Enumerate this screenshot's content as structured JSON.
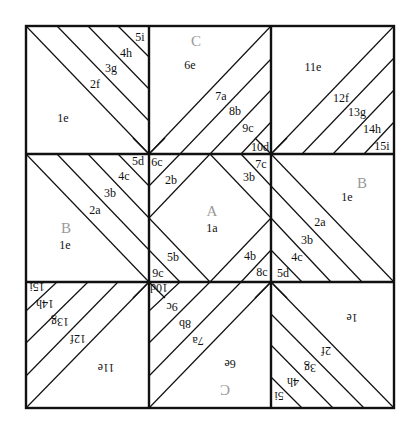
{
  "diagram": {
    "type": "quilt-block-foundation-pattern",
    "frame": {
      "x0": 26,
      "y0": 26,
      "x1": 394,
      "y1": 408
    },
    "grid": {
      "cols": [
        26,
        149,
        271,
        394
      ],
      "rows": [
        26,
        154,
        282,
        408
      ]
    },
    "colors": {
      "line": "#111111",
      "unit_letter": "#999999",
      "background": "#ffffff"
    },
    "units": [
      {
        "id": "C",
        "label": "C",
        "x": 196,
        "y": 41,
        "flip": false
      },
      {
        "id": "A",
        "label": "A",
        "x": 212,
        "y": 211,
        "flip": false
      },
      {
        "id": "B-left",
        "label": "B",
        "x": 66,
        "y": 228,
        "flip": false
      },
      {
        "id": "B-right",
        "label": "B",
        "x": 362,
        "y": 183,
        "flip": false
      },
      {
        "id": "C-bottom",
        "label": "C",
        "x": 225,
        "y": 389,
        "flip": true
      }
    ],
    "pieces": [
      {
        "label": "5i",
        "x": 140,
        "y": 37,
        "flip": false
      },
      {
        "label": "4h",
        "x": 126,
        "y": 53,
        "flip": false
      },
      {
        "label": "3g",
        "x": 111,
        "y": 68,
        "flip": false
      },
      {
        "label": "2f",
        "x": 95,
        "y": 84,
        "flip": false
      },
      {
        "label": "1e",
        "x": 63,
        "y": 118,
        "flip": false
      },
      {
        "label": "6e",
        "x": 190,
        "y": 65,
        "flip": false
      },
      {
        "label": "7a",
        "x": 221,
        "y": 96,
        "flip": false
      },
      {
        "label": "8b",
        "x": 235,
        "y": 111,
        "flip": false
      },
      {
        "label": "9c",
        "x": 248,
        "y": 128,
        "flip": false
      },
      {
        "label": "10d",
        "x": 260,
        "y": 147,
        "flip": false
      },
      {
        "label": "11e",
        "x": 313,
        "y": 67,
        "flip": false
      },
      {
        "label": "12f",
        "x": 341,
        "y": 98,
        "flip": false
      },
      {
        "label": "13g",
        "x": 357,
        "y": 112,
        "flip": false
      },
      {
        "label": "14h",
        "x": 372,
        "y": 129,
        "flip": false
      },
      {
        "label": "15i",
        "x": 382,
        "y": 146,
        "flip": false
      },
      {
        "label": "5d",
        "x": 138,
        "y": 161,
        "flip": false
      },
      {
        "label": "4c",
        "x": 124,
        "y": 176,
        "flip": false
      },
      {
        "label": "3b",
        "x": 110,
        "y": 193,
        "flip": false
      },
      {
        "label": "2a",
        "x": 95,
        "y": 210,
        "flip": false
      },
      {
        "label": "1e",
        "x": 65,
        "y": 245,
        "flip": false
      },
      {
        "label": "6c",
        "x": 157,
        "y": 162,
        "flip": false
      },
      {
        "label": "2b",
        "x": 171,
        "y": 180,
        "flip": false
      },
      {
        "label": "3b",
        "x": 249,
        "y": 177,
        "flip": false
      },
      {
        "label": "7c",
        "x": 261,
        "y": 164,
        "flip": false
      },
      {
        "label": "1a",
        "x": 212,
        "y": 228,
        "flip": false
      },
      {
        "label": "5b",
        "x": 173,
        "y": 257,
        "flip": false
      },
      {
        "label": "4b",
        "x": 250,
        "y": 256,
        "flip": false
      },
      {
        "label": "9c",
        "x": 158,
        "y": 273,
        "flip": false
      },
      {
        "label": "8c",
        "x": 262,
        "y": 272,
        "flip": false
      },
      {
        "label": "1e",
        "x": 347,
        "y": 197,
        "flip": false
      },
      {
        "label": "2a",
        "x": 320,
        "y": 222,
        "flip": false
      },
      {
        "label": "3b",
        "x": 307,
        "y": 240,
        "flip": false
      },
      {
        "label": "4c",
        "x": 297,
        "y": 257,
        "flip": false
      },
      {
        "label": "5d",
        "x": 283,
        "y": 273,
        "flip": false
      },
      {
        "label": "15i",
        "x": 37,
        "y": 287,
        "flip": true
      },
      {
        "label": "14h",
        "x": 45,
        "y": 304,
        "flip": true
      },
      {
        "label": "13g",
        "x": 60,
        "y": 322,
        "flip": true
      },
      {
        "label": "12f",
        "x": 78,
        "y": 339,
        "flip": true
      },
      {
        "label": "11e",
        "x": 106,
        "y": 368,
        "flip": true
      },
      {
        "label": "10d",
        "x": 159,
        "y": 288,
        "flip": true
      },
      {
        "label": "9c",
        "x": 172,
        "y": 307,
        "flip": true
      },
      {
        "label": "8b",
        "x": 185,
        "y": 324,
        "flip": true
      },
      {
        "label": "7a",
        "x": 198,
        "y": 341,
        "flip": true
      },
      {
        "label": "6e",
        "x": 230,
        "y": 364,
        "flip": true
      },
      {
        "label": "1e",
        "x": 352,
        "y": 318,
        "flip": true
      },
      {
        "label": "2f",
        "x": 326,
        "y": 351,
        "flip": true
      },
      {
        "label": "3g",
        "x": 310,
        "y": 368,
        "flip": true
      },
      {
        "label": "4h",
        "x": 293,
        "y": 382,
        "flip": true
      },
      {
        "label": "5i",
        "x": 279,
        "y": 396,
        "flip": true
      }
    ]
  }
}
